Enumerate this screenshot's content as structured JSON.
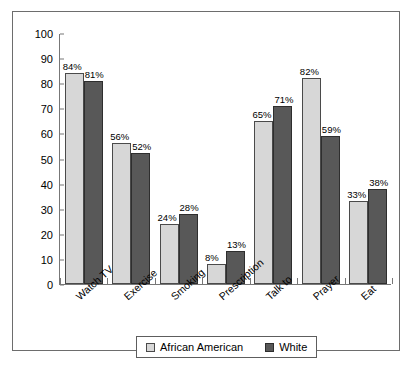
{
  "chart_data": {
    "type": "bar",
    "title": "",
    "xlabel": "",
    "ylabel": "",
    "ylim": [
      0,
      100
    ],
    "ytick_step": 10,
    "yticks": [
      100,
      90,
      80,
      70,
      60,
      50,
      40,
      30,
      20,
      10,
      0
    ],
    "grid": false,
    "legend_position": "bottom",
    "categories": [
      "Watch TV",
      "Exercise",
      "Smoking",
      "Prescription",
      "Talk to",
      "Prayer",
      "Eat"
    ],
    "series": [
      {
        "name": "African American",
        "color": "#d7d7d7",
        "values": [
          84,
          56,
          24,
          8,
          65,
          82,
          33
        ],
        "labels": [
          "84%",
          "56%",
          "24%",
          "8%",
          "65%",
          "82%",
          "33%"
        ]
      },
      {
        "name": "White",
        "color": "#585858",
        "values": [
          81,
          52,
          28,
          13,
          71,
          59,
          38
        ],
        "labels": [
          "81%",
          "52%",
          "28%",
          "13%",
          "71%",
          "59%",
          "38%"
        ]
      }
    ]
  },
  "legend": {
    "items": [
      {
        "label": "African American",
        "swatch": "aa"
      },
      {
        "label": "White",
        "swatch": "wh"
      }
    ]
  }
}
